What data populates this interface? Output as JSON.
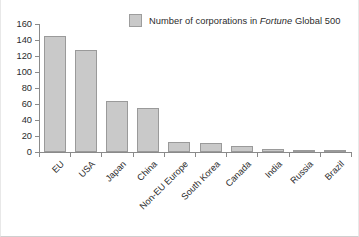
{
  "chart_data": {
    "type": "bar",
    "title": "",
    "subtitle": "",
    "xlabel": "",
    "ylabel": "",
    "categories": [
      "EU",
      "USA",
      "Japan",
      "China",
      "Non-EU Europe",
      "South Korea",
      "Canada",
      "India",
      "Russia",
      "Brazil"
    ],
    "values": [
      145,
      128,
      64,
      55,
      13,
      11,
      7,
      4,
      3,
      3
    ],
    "series": [
      {
        "name": "Number of corporations in Fortune Global 500",
        "values": [
          145,
          128,
          64,
          55,
          13,
          11,
          7,
          4,
          3,
          3
        ]
      }
    ],
    "ylim": [
      0,
      160
    ],
    "ytick_values": [
      0,
      20,
      40,
      60,
      80,
      100,
      120,
      140,
      160
    ],
    "ytick_labels": [
      "0",
      "20",
      "40",
      "60",
      "80",
      "100",
      "120",
      "140",
      "160"
    ],
    "grid": false,
    "legend_position": "top-right",
    "bar_color": "#c9c9c9",
    "bar_border_color": "#9a9a9a",
    "axis_color": "#8a8a8a",
    "text_color": "#2b2b2b",
    "background_color": "#ffffff",
    "xtick_rotation": -45
  },
  "legend": {
    "swatch_name": "legend-color-swatch",
    "label_prefix": "Number of corporations in ",
    "label_italic": "Fortune",
    "label_suffix": " Global 500",
    "label_full": "Number of corporations in Fortune Global 500"
  }
}
